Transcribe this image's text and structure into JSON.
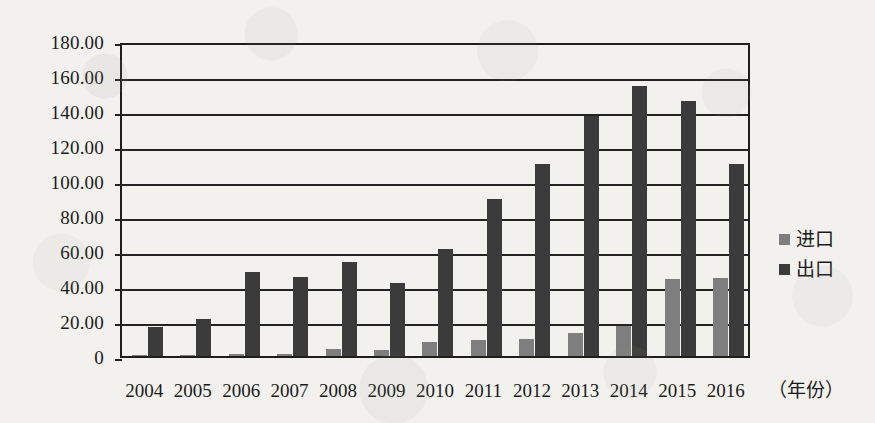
{
  "chart_data": {
    "type": "bar",
    "title": "",
    "xlabel": "（年份）",
    "ylabel": "",
    "categories": [
      "2004",
      "2005",
      "2006",
      "2007",
      "2008",
      "2009",
      "2010",
      "2011",
      "2012",
      "2013",
      "2014",
      "2015",
      "2016"
    ],
    "series": [
      {
        "name": "进口",
        "color": "#7e7e7e",
        "values": [
          0.3,
          0.5,
          1.0,
          1.2,
          4.0,
          3.5,
          8.0,
          9.0,
          10.0,
          13.0,
          17.0,
          44.0,
          44.5
        ]
      },
      {
        "name": "出口",
        "color": "#3b3b3b",
        "values": [
          16.5,
          21.0,
          48.0,
          45.0,
          53.5,
          42.0,
          61.0,
          90.0,
          110.0,
          137.0,
          154.5,
          146.0,
          110.0
        ]
      }
    ],
    "ylim": [
      0,
      180
    ],
    "ytick_values": [
      180,
      160,
      140,
      120,
      100,
      80,
      60,
      40,
      20,
      0
    ],
    "ytick_labels": [
      "180.00",
      "160.00",
      "140.00",
      "120.00",
      "100.00",
      "80.00",
      "60.00",
      "40.00",
      "20.00",
      "0"
    ],
    "grid": true,
    "legend_position": "right"
  },
  "legend": {
    "items": [
      {
        "label": "进口",
        "color": "#7e7e7e"
      },
      {
        "label": "出口",
        "color": "#3b3b3b"
      }
    ]
  },
  "axis": {
    "x_title": "（年份）"
  },
  "colors": {
    "background": "#f2f1ee",
    "axis": "#232323",
    "import": "#7e7e7e",
    "export": "#3b3b3b"
  }
}
